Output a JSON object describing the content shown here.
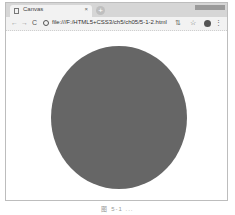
{
  "browser": {
    "tab": {
      "title": "Canvas",
      "close": "×"
    },
    "new_tab": "+",
    "toolbar": {
      "back": "←",
      "forward": "→",
      "reload": "C",
      "url": "file:///F:/HTML5+CSS3/ch5/ch05/5-1-2.html",
      "extension": "⇅",
      "bookmark": "☆",
      "menu": "⋮"
    }
  },
  "canvas": {
    "shape": "circle",
    "fill_color": "#666666"
  },
  "caption": "图 5-1 ..."
}
